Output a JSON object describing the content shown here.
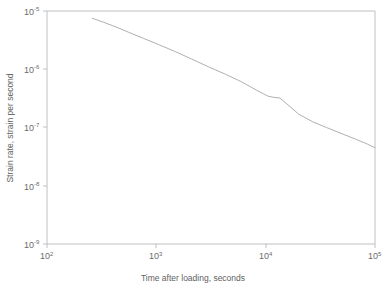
{
  "chart_data": {
    "type": "line",
    "title": "",
    "xlabel": "Time after loading, seconds",
    "ylabel": "Strain rate, strain per second",
    "xscale": "log",
    "yscale": "log",
    "xlim": [
      100,
      100000
    ],
    "ylim": [
      1e-09,
      1e-05
    ],
    "grid": false,
    "legend": null,
    "xticks": [
      100,
      1000,
      10000,
      100000
    ],
    "xtick_labels": [
      "10",
      "10",
      "10",
      "10"
    ],
    "xtick_exponents": [
      "2",
      "3",
      "4",
      "5"
    ],
    "yticks": [
      1e-05,
      1e-06,
      1e-07,
      1e-08,
      1e-09
    ],
    "ytick_labels": [
      "10",
      "10",
      "10",
      "10",
      "10"
    ],
    "ytick_exponents": [
      "-5",
      "-6",
      "-7",
      "-8",
      "-9"
    ],
    "series": [
      {
        "name": "strain rate",
        "color": "#b0b0b0",
        "x": [
          260,
          330,
          430,
          560,
          760,
          1050,
          1500,
          2100,
          3000,
          4300,
          6000,
          8200,
          10500,
          11800,
          13500,
          16000,
          20000,
          27000,
          36000,
          50000,
          68000,
          85000,
          100000
        ],
        "y": [
          7.5e-06,
          6.4e-06,
          5.3e-06,
          4.3e-06,
          3.4e-06,
          2.65e-06,
          2e-06,
          1.5e-06,
          1.1e-06,
          8.2e-07,
          6.1e-07,
          4.4e-07,
          3.45e-07,
          3.3e-07,
          3.2e-07,
          2.45e-07,
          1.7e-07,
          1.25e-07,
          1e-07,
          7.8e-08,
          6.2e-08,
          5.2e-08,
          4.5e-08
        ]
      }
    ],
    "annotations": [
      {
        "type": "kink",
        "x": 11800,
        "y": 3.3e-07,
        "note": "small plateau / bump in the curve near 1.1e4 s"
      }
    ]
  },
  "figure": {
    "background_color": "#ffffff",
    "axis_color": "#b9b9b9",
    "text_color": "#6b6b6b",
    "line_color": "#b0b0b0"
  }
}
